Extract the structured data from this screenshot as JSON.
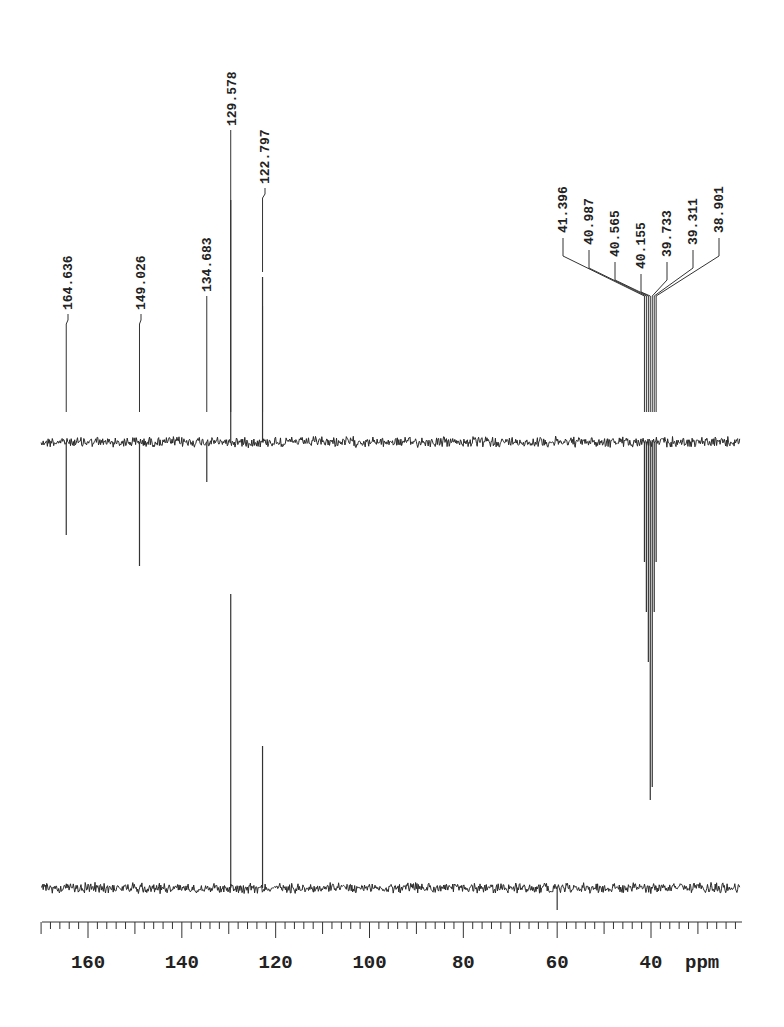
{
  "chart_data": {
    "type": "line",
    "title": "",
    "xlabel": "ppm",
    "ylabel": "",
    "xlim": [
      170,
      21
    ],
    "x_reversed": true,
    "grid": false,
    "x_ticks": [
      {
        "value": 160,
        "label": "160"
      },
      {
        "value": 140,
        "label": "140"
      },
      {
        "value": 120,
        "label": "120"
      },
      {
        "value": 100,
        "label": "100"
      },
      {
        "value": 80,
        "label": "80"
      },
      {
        "value": 60,
        "label": "60"
      },
      {
        "value": 40,
        "label": "40"
      }
    ],
    "x_unit_label": "ppm",
    "minor_tick_step": 2,
    "peak_labels": [
      "164.636",
      "149.026",
      "134.683",
      "129.578",
      "122.797",
      "41.396",
      "40.987",
      "40.565",
      "40.155",
      "39.733",
      "39.311",
      "38.901"
    ],
    "series": [
      {
        "name": "upper trace",
        "baseline_y": 442,
        "peaks": [
          {
            "ppm": 164.636,
            "height": -93
          },
          {
            "ppm": 149.026,
            "height": -124
          },
          {
            "ppm": 134.683,
            "height": -40
          },
          {
            "ppm": 129.578,
            "height": 242
          },
          {
            "ppm": 122.797,
            "height": 165
          },
          {
            "ppm": 41.396,
            "height": -120
          },
          {
            "ppm": 40.987,
            "height": -170
          },
          {
            "ppm": 40.565,
            "height": -220
          },
          {
            "ppm": 40.155,
            "height": -358
          },
          {
            "ppm": 39.733,
            "height": -345
          },
          {
            "ppm": 39.311,
            "height": -170
          },
          {
            "ppm": 38.901,
            "height": -120
          }
        ]
      },
      {
        "name": "lower trace",
        "baseline_y": 888,
        "peaks": [
          {
            "ppm": 129.578,
            "height": 294
          },
          {
            "ppm": 122.797,
            "height": 142
          },
          {
            "ppm": 60.0,
            "height": -22
          }
        ]
      }
    ]
  },
  "labels": {
    "group_left": {
      "items": [
        {
          "ppm": 164.636,
          "text": "164.636"
        },
        {
          "ppm": 149.026,
          "text": "149.026"
        },
        {
          "ppm": 134.683,
          "text": "134.683"
        },
        {
          "ppm": 129.578,
          "text": "129.578"
        },
        {
          "ppm": 122.797,
          "text": "122.797"
        }
      ]
    },
    "group_right": {
      "items": [
        {
          "ppm": 41.396,
          "text": "41.396"
        },
        {
          "ppm": 40.987,
          "text": "40.987"
        },
        {
          "ppm": 40.565,
          "text": "40.565"
        },
        {
          "ppm": 40.155,
          "text": "40.155"
        },
        {
          "ppm": 39.733,
          "text": "39.733"
        },
        {
          "ppm": 39.311,
          "text": "39.311"
        },
        {
          "ppm": 38.901,
          "text": "38.901"
        }
      ]
    }
  },
  "axis": {
    "unit": "ppm"
  }
}
